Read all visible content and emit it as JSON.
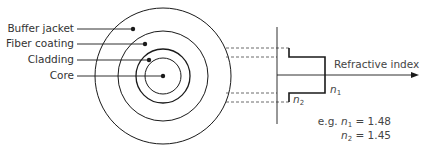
{
  "diagram": {
    "layers": [
      {
        "label": "Buffer jacket"
      },
      {
        "label": "Fiber coating"
      },
      {
        "label": "Cladding"
      },
      {
        "label": "Core"
      }
    ],
    "axis_label": "Refractive index",
    "profile": {
      "n1_symbol": "n",
      "n1_sub": "1",
      "n2_symbol": "n",
      "n2_sub": "2"
    },
    "example": {
      "prefix": "e.g.",
      "n1_symbol": "n",
      "n1_sub": "1",
      "n1_value": "= 1.48",
      "n2_symbol": "n",
      "n2_sub": "2",
      "n2_value": "= 1.45"
    },
    "colors": {
      "line": "#1a1a1a",
      "dashed": "#444444",
      "text": "#333333"
    }
  }
}
